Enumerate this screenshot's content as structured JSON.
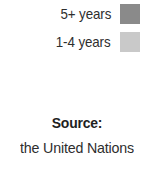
{
  "chart_data": {
    "type": "bar",
    "title": "",
    "xlabel": "",
    "ylabel": "",
    "categories": [],
    "series": [
      {
        "name": "5+ years",
        "color": "#8a8a8a",
        "values": []
      },
      {
        "name": "1-4 years",
        "color": "#c9c9c9",
        "values": []
      }
    ],
    "legend_position": "top-right",
    "grid": false,
    "annotations": [
      "Source: the United Nations"
    ]
  },
  "legend": {
    "items": [
      {
        "label": "5+ years",
        "color": "#8a8a8a"
      },
      {
        "label": "1-4 years",
        "color": "#c9c9c9"
      }
    ]
  },
  "source": {
    "heading": "Source:",
    "name": "the United Nations"
  },
  "colors": {
    "background": "#ffffff",
    "text": "#2e2e2e",
    "heading": "#1f1f1f",
    "swatch_dark": "#8a8a8a",
    "swatch_light": "#c9c9c9"
  }
}
